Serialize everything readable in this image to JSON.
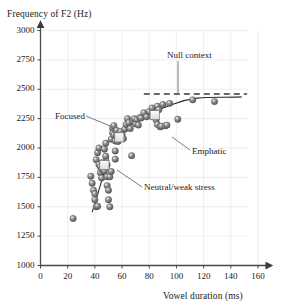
{
  "chart_data": {
    "type": "scatter",
    "title": "",
    "xlabel": "Vowel duration (ms)",
    "ylabel": "Frequency of F2 (Hz)",
    "xlim": [
      0,
      160
    ],
    "ylim": [
      1000,
      3000
    ],
    "xticks": [
      0,
      20,
      40,
      60,
      80,
      100,
      120,
      140,
      160
    ],
    "yticks": [
      1000,
      1250,
      1500,
      1750,
      2000,
      2250,
      2500,
      2750,
      3000
    ],
    "grid": true,
    "legend_position": "none",
    "marker_style": "shaded-gray-sphere",
    "series": [
      {
        "name": "F2 observations",
        "marker": "sphere",
        "color": "#7d7d7d",
        "points": [
          [
            24,
            1400
          ],
          [
            37,
            1760
          ],
          [
            38,
            1700
          ],
          [
            39,
            1640
          ],
          [
            40,
            1610
          ],
          [
            40,
            1560
          ],
          [
            41,
            1500
          ],
          [
            42,
            1505
          ],
          [
            41,
            1900
          ],
          [
            42,
            1960
          ],
          [
            43,
            2000
          ],
          [
            43,
            1860
          ],
          [
            44,
            1840
          ],
          [
            44,
            1790
          ],
          [
            45,
            1820
          ],
          [
            45,
            1745
          ],
          [
            46,
            1880
          ],
          [
            46,
            1835
          ],
          [
            47,
            1805
          ],
          [
            47,
            1990
          ],
          [
            48,
            2040
          ],
          [
            48,
            1930
          ],
          [
            48,
            1870
          ],
          [
            49,
            1855
          ],
          [
            49,
            1755
          ],
          [
            49,
            1680
          ],
          [
            50,
            1640
          ],
          [
            50,
            1560
          ],
          [
            51,
            1500
          ],
          [
            51,
            1755
          ],
          [
            52,
            1800
          ],
          [
            52,
            2075
          ],
          [
            53,
            2130
          ],
          [
            53,
            2170
          ],
          [
            54,
            2190
          ],
          [
            54,
            2110
          ],
          [
            55,
            2060
          ],
          [
            55,
            1975
          ],
          [
            55,
            1905
          ],
          [
            56,
            2110
          ],
          [
            56,
            2150
          ],
          [
            57,
            2090
          ],
          [
            57,
            2055
          ],
          [
            58,
            2125
          ],
          [
            59,
            2140
          ],
          [
            60,
            2115
          ],
          [
            61,
            2080
          ],
          [
            62,
            2160
          ],
          [
            63,
            2200
          ],
          [
            64,
            2250
          ],
          [
            65,
            2215
          ],
          [
            66,
            2165
          ],
          [
            67,
            1935
          ],
          [
            68,
            2230
          ],
          [
            69,
            2250
          ],
          [
            70,
            2205
          ],
          [
            71,
            2240
          ],
          [
            72,
            2195
          ],
          [
            73,
            2260
          ],
          [
            74,
            2255
          ],
          [
            76,
            2300
          ],
          [
            78,
            2265
          ],
          [
            80,
            2310
          ],
          [
            82,
            2340
          ],
          [
            84,
            2290
          ],
          [
            85,
            2240
          ],
          [
            86,
            2200
          ],
          [
            86,
            2355
          ],
          [
            87,
            2325
          ],
          [
            88,
            2180
          ],
          [
            89,
            2185
          ],
          [
            90,
            2370
          ],
          [
            92,
            2190
          ],
          [
            93,
            2195
          ],
          [
            95,
            2380
          ],
          [
            101,
            2245
          ],
          [
            112,
            2410
          ],
          [
            128,
            2395
          ]
        ]
      },
      {
        "name": "Group means",
        "marker": "white-square",
        "color": "#f2f2f2",
        "points": [
          [
            47,
            1855
          ],
          [
            58,
            2090
          ],
          [
            84,
            2280
          ]
        ]
      }
    ],
    "reference_line": {
      "label": "Null context",
      "style": "dashed",
      "orientation": "horizontal",
      "y": 2460,
      "x_start": 76,
      "x_end": 152
    },
    "fit_curves": [
      {
        "name": "saturating-fit",
        "style": "solid",
        "description": "curve rising through clusters and asymptoting to the null-context level"
      },
      {
        "name": "low-cluster-trend",
        "style": "solid",
        "description": "short straight segment through the low duration cluster"
      }
    ],
    "annotations": [
      {
        "label": "Null context",
        "pointer": "down"
      },
      {
        "label": "Focused",
        "pointer": "right"
      },
      {
        "label": "Emphatic",
        "pointer": "up-left"
      },
      {
        "label": "Neutral/weak stress",
        "pointer": "up-left"
      }
    ]
  },
  "axes": {
    "y_title": "Frequency of F2 (Hz)",
    "x_title": "Vowel duration (ms)",
    "y_ticks": [
      "3000",
      "2750",
      "2500",
      "2250",
      "2000",
      "1750",
      "1500",
      "1250",
      "1000"
    ],
    "x_ticks": [
      "0",
      "20",
      "40",
      "60",
      "80",
      "100",
      "120",
      "140",
      "160"
    ]
  },
  "labels": {
    "null_context": "Null context",
    "focused": "Focused",
    "emphatic": "Emphatic",
    "neutral": "Neutral/weak stress"
  },
  "colors": {
    "axis": "#4a4a4a",
    "grid": "#e4e4ea",
    "marker": "#7d7d7d",
    "marker_dark": "#5a5a5a",
    "square": "#f0f0f0",
    "text": "#1a1a1a",
    "leader": "#6b6b6b"
  }
}
